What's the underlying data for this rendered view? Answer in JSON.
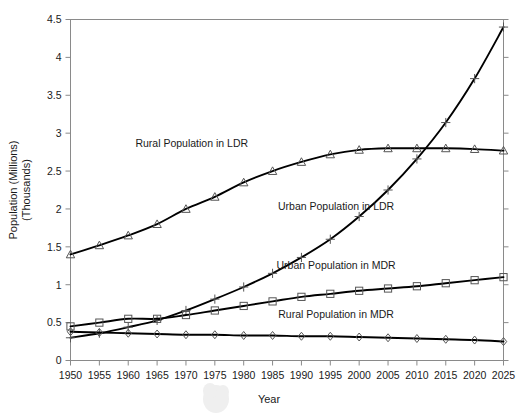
{
  "chart_data": {
    "type": "line",
    "title": "",
    "xlabel": "Year",
    "ylabel": "Population (Millions)\n(Thousands)",
    "ylabel_line1": "Population (Millions)",
    "ylabel_line2": "(Thousands)",
    "x": [
      1950,
      1955,
      1960,
      1965,
      1970,
      1975,
      1980,
      1985,
      1990,
      1995,
      2000,
      2005,
      2010,
      2015,
      2020,
      2025
    ],
    "categories": [
      "1950",
      "1955",
      "1960",
      "1965",
      "1970",
      "1975",
      "1980",
      "1985",
      "1990",
      "1995",
      "2000",
      "2005",
      "2010",
      "2015",
      "2020",
      "2025"
    ],
    "xlim": [
      1950,
      2025
    ],
    "ylim": [
      0,
      4.5
    ],
    "ytick_labels": [
      "0",
      "0.5",
      "1",
      "1.5",
      "2",
      "2.5",
      "3",
      "3.5",
      "4",
      "4.5"
    ],
    "ytick_values": [
      0,
      0.5,
      1,
      1.5,
      2,
      2.5,
      3,
      3.5,
      4,
      4.5
    ],
    "grid": false,
    "legend_position": "inline-annotations",
    "series": [
      {
        "name": "Rural Population in LDR",
        "marker": "triangle",
        "label_x": 1971,
        "label_y": 2.82,
        "values": [
          1.4,
          1.52,
          1.65,
          1.8,
          2.0,
          2.16,
          2.35,
          2.5,
          2.62,
          2.72,
          2.78,
          2.8,
          2.8,
          2.8,
          2.79,
          2.77
        ]
      },
      {
        "name": "Urban Population in LDR",
        "marker": "plus",
        "label_x": 1996,
        "label_y": 1.98,
        "values": [
          0.3,
          0.36,
          0.44,
          0.53,
          0.66,
          0.81,
          0.97,
          1.15,
          1.36,
          1.6,
          1.9,
          2.25,
          2.66,
          3.14,
          3.72,
          4.4
        ]
      },
      {
        "name": "Urban Population in MDR",
        "marker": "square",
        "label_x": 1996,
        "label_y": 1.21,
        "values": [
          0.45,
          0.5,
          0.55,
          0.55,
          0.6,
          0.66,
          0.72,
          0.78,
          0.84,
          0.88,
          0.92,
          0.95,
          0.98,
          1.02,
          1.06,
          1.1
        ]
      },
      {
        "name": "Rural Population in MDR",
        "marker": "diamond",
        "label_x": 1996,
        "label_y": 0.56,
        "values": [
          0.38,
          0.37,
          0.36,
          0.35,
          0.34,
          0.34,
          0.33,
          0.33,
          0.32,
          0.32,
          0.31,
          0.3,
          0.29,
          0.28,
          0.27,
          0.25
        ]
      }
    ]
  }
}
